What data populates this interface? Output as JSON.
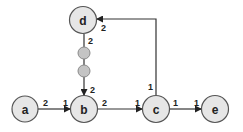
{
  "diagram": {
    "type": "directed-graph",
    "nodes": [
      {
        "id": "a",
        "label": "a",
        "cx": 25,
        "cy": 109
      },
      {
        "id": "b",
        "label": "b",
        "cx": 84,
        "cy": 109
      },
      {
        "id": "c",
        "label": "c",
        "cx": 156,
        "cy": 109
      },
      {
        "id": "e",
        "label": "e",
        "cx": 215,
        "cy": 109
      },
      {
        "id": "d",
        "label": "d",
        "cx": 83,
        "cy": 20
      }
    ],
    "intermediate_points": [
      {
        "cx": 84,
        "cy": 53
      },
      {
        "cx": 84,
        "cy": 71
      }
    ],
    "edges": [
      {
        "from": "a",
        "to": "b",
        "src_port": "2",
        "dst_port": "1"
      },
      {
        "from": "b",
        "to": "c",
        "src_port": "2",
        "dst_port": "1"
      },
      {
        "from": "c",
        "to": "e",
        "src_port": "1",
        "dst_port": "1"
      },
      {
        "from": "c",
        "to": "d",
        "src_port": "1",
        "dst_port": "2"
      },
      {
        "from": "d",
        "to": "b",
        "src_port": "2",
        "dst_port": "2"
      }
    ],
    "colors": {
      "node_fill": "#e6e6e6",
      "node_stroke": "#555555",
      "mini_fill": "#c4c4c4",
      "edge": "#333333"
    }
  }
}
